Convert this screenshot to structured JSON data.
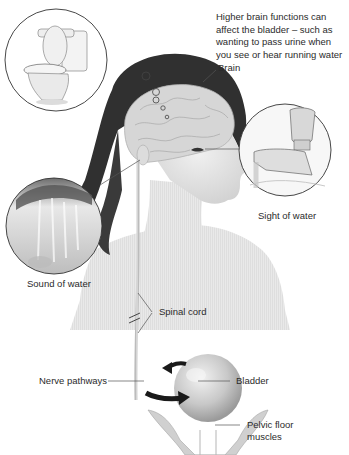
{
  "caption": "Higher brain functions can affect the bladder – such as wanting to pass urine when you see or hear running water",
  "labels": {
    "brain": "Brain",
    "sight_of_water": "Sight of water",
    "sound_of_water": "Sound of water",
    "spinal_cord": "Spinal cord",
    "nerve_pathways": "Nerve pathways",
    "bladder": "Bladder",
    "pelvic_floor_line1": "Pelvic floor",
    "pelvic_floor_line2": "muscles"
  },
  "insets": [
    {
      "name": "toilet",
      "depicts": "toilet-illustration"
    },
    {
      "name": "tap",
      "depicts": "water-tap-illustration"
    },
    {
      "name": "waterfall",
      "depicts": "running-water-photo"
    }
  ],
  "colors": {
    "background": "#ffffff",
    "text": "#2b2b2b",
    "hair": "#2e2e2e",
    "skin": "#e6e6e6",
    "brain": "#d4d4d4",
    "arrow": "#1a1a1a",
    "leader_line": "#555555"
  }
}
